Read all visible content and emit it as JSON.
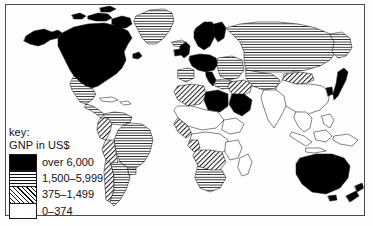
{
  "figure": {
    "kind": "choropleth-world-map",
    "subject": "GNP in US$",
    "background_color": "#fdfdfd",
    "frame_color": "#4a4a4a",
    "ink_color": "#111111"
  },
  "legend": {
    "title_line_1": "key:",
    "title_line_2": "GNP in US$",
    "entries": [
      {
        "label": "over 6,000",
        "pattern": "solid-black",
        "swatch_class": "sw-solid"
      },
      {
        "label": "1,500–5,999",
        "pattern": "horizontal-lines",
        "swatch_class": "sw-hlines"
      },
      {
        "label": "375–1,499",
        "pattern": "diagonal-hatch",
        "swatch_class": "sw-diag"
      },
      {
        "label": "0–374",
        "pattern": "blank-white",
        "swatch_class": "sw-blank"
      }
    ]
  },
  "map_regions": {
    "solid_black": [
      "Canada",
      "United States",
      "Greenland-margin",
      "United Kingdom",
      "Ireland",
      "Norway",
      "Sweden",
      "Finland",
      "Denmark",
      "Netherlands",
      "Belgium",
      "Germany",
      "France",
      "Switzerland",
      "Austria",
      "Italy",
      "Libya",
      "Saudi Arabia",
      "Japan",
      "Australia",
      "New Zealand"
    ],
    "horizontal_lines": [
      "Greenland",
      "Iceland",
      "Mexico",
      "Central America",
      "Soviet Union",
      "Eastern Europe",
      "Spain",
      "Portugal",
      "Venezuela",
      "Brazil",
      "Argentina",
      "Uruguay",
      "South Africa",
      "Gabon"
    ],
    "diagonal_hatch": [
      "Morocco",
      "Algeria",
      "Tunisia",
      "Egypt",
      "Turkey",
      "Iran",
      "Iraq",
      "Mongolia",
      "Colombia",
      "Ecuador",
      "Peru",
      "Chile",
      "Paraguay",
      "Bolivia",
      "Angola",
      "Zambia",
      "Zimbabwe",
      "Namibia",
      "Botswana",
      "Ivory Coast",
      "Nigeria"
    ],
    "blank_white": [
      "China",
      "India",
      "Pakistan",
      "Bangladesh",
      "Burma",
      "Thailand",
      "Vietnam",
      "Indonesia",
      "Philippines",
      "Sudan",
      "Ethiopia",
      "Somalia",
      "Kenya",
      "Tanzania",
      "Zaire",
      "Chad",
      "Niger",
      "Mali",
      "Mauritania",
      "Madagascar"
    ]
  }
}
